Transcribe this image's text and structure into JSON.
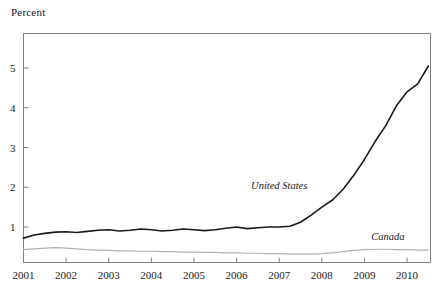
{
  "axis_title": "Percent",
  "chart_data": {
    "type": "line",
    "title": "",
    "subtitle": "",
    "xlabel": "",
    "ylabel": "Percent",
    "xlim": [
      2001,
      2010.55
    ],
    "ylim": [
      0,
      5.6
    ],
    "yticks": [
      1,
      2,
      3,
      4,
      5
    ],
    "ytick_labels": [
      "1",
      "2",
      "3",
      "4",
      "5"
    ],
    "xticks": [
      2001,
      2002,
      2003,
      2004,
      2005,
      2006,
      2007,
      2008,
      2009,
      2010
    ],
    "xtick_labels": [
      "2001",
      "2002",
      "2003",
      "2004",
      "2005",
      "2006",
      "2007",
      "2008",
      "2009",
      "2010"
    ],
    "grid": false,
    "legend": "inline-annotations",
    "series": [
      {
        "name": "United States",
        "color": "#1a1a1a",
        "width": 1.6,
        "label_position": {
          "x": 2007.0,
          "y": 1.95
        },
        "x": [
          2001.0,
          2001.25,
          2001.5,
          2001.75,
          2002.0,
          2002.25,
          2002.5,
          2002.75,
          2003.0,
          2003.25,
          2003.5,
          2003.75,
          2004.0,
          2004.25,
          2004.5,
          2004.75,
          2005.0,
          2005.25,
          2005.5,
          2005.75,
          2006.0,
          2006.25,
          2006.5,
          2006.75,
          2007.0,
          2007.25,
          2007.5,
          2007.75,
          2008.0,
          2008.25,
          2008.5,
          2008.75,
          2009.0,
          2009.25,
          2009.5,
          2009.75,
          2010.0,
          2010.25,
          2010.5
        ],
        "y": [
          0.72,
          0.8,
          0.84,
          0.87,
          0.88,
          0.86,
          0.89,
          0.92,
          0.93,
          0.9,
          0.92,
          0.95,
          0.93,
          0.9,
          0.92,
          0.95,
          0.93,
          0.91,
          0.93,
          0.97,
          1.0,
          0.96,
          0.98,
          1.0,
          1.0,
          1.02,
          1.12,
          1.3,
          1.5,
          1.68,
          1.95,
          2.3,
          2.7,
          3.15,
          3.55,
          4.05,
          4.4,
          4.6,
          5.05
        ]
      },
      {
        "name": "Canada",
        "color": "#b0b0b0",
        "width": 1.2,
        "label_position": {
          "x": 2009.55,
          "y": 0.68
        },
        "x": [
          2001.0,
          2001.25,
          2001.5,
          2001.75,
          2002.0,
          2002.25,
          2002.5,
          2002.75,
          2003.0,
          2003.25,
          2003.5,
          2003.75,
          2004.0,
          2004.25,
          2004.5,
          2004.75,
          2005.0,
          2005.25,
          2005.5,
          2005.75,
          2006.0,
          2006.25,
          2006.5,
          2006.75,
          2007.0,
          2007.25,
          2007.5,
          2007.75,
          2008.0,
          2008.25,
          2008.5,
          2008.75,
          2009.0,
          2009.25,
          2009.5,
          2009.75,
          2010.0,
          2010.25,
          2010.5
        ],
        "y": [
          0.43,
          0.45,
          0.47,
          0.48,
          0.47,
          0.45,
          0.43,
          0.42,
          0.41,
          0.4,
          0.4,
          0.39,
          0.39,
          0.38,
          0.38,
          0.37,
          0.37,
          0.36,
          0.36,
          0.35,
          0.35,
          0.34,
          0.34,
          0.33,
          0.33,
          0.32,
          0.32,
          0.32,
          0.33,
          0.35,
          0.38,
          0.41,
          0.43,
          0.44,
          0.44,
          0.43,
          0.43,
          0.42,
          0.42
        ]
      }
    ]
  },
  "annotations": [
    {
      "text": "United States"
    },
    {
      "text": "Canada"
    }
  ],
  "colors": {
    "axis": "#808080",
    "united_states_line": "#1a1a1a",
    "canada_line": "#b0b0b0",
    "text": "#1a1a1a",
    "background": "#ffffff"
  }
}
